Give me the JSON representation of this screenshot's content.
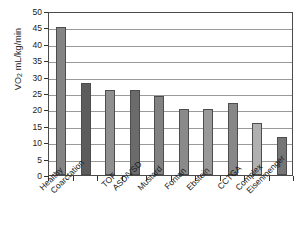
{
  "chart_data": {
    "type": "bar",
    "title": "",
    "subtitle": "",
    "xlabel": "",
    "ylabel": "VO2 mL/kg/min",
    "ylabel_parts": {
      "prefix": "VO",
      "subscript": "2",
      "suffix": " mL/kg/min"
    },
    "categories": [
      "Healthy",
      "Coarctation",
      "TOF",
      "ASD/VSD",
      "Mustard",
      "Fontan",
      "Ebstein",
      "CCTGA",
      "Complex",
      "Eisenmenger"
    ],
    "values": [
      45,
      28,
      26,
      26,
      24,
      20,
      20,
      22,
      16,
      11.7
    ],
    "bar_colors": [
      "#848484",
      "#5c5c5c",
      "#8f8f8f",
      "#6b6b6b",
      "#828282",
      "#8a8a8a",
      "#999999",
      "#878787",
      "#b0b0b0",
      "#767676"
    ],
    "ylim": [
      0,
      50
    ],
    "yticks": [
      0,
      5,
      10,
      15,
      20,
      25,
      30,
      35,
      40,
      45,
      50
    ],
    "ytick_labels": [
      "0",
      "5",
      "10",
      "15",
      "20",
      "25",
      "30",
      "35",
      "40",
      "45",
      "50"
    ],
    "grid": true,
    "grid_axis": "y",
    "legend": false,
    "legend_position": "none",
    "frame": true,
    "bar_width_fraction": 0.42,
    "colors": {
      "axis": "#4a4a4a",
      "gridline": "#9a9a9a",
      "text": "#1a1a1a",
      "background": "#ffffff",
      "bar_outline": "#4d4d4d"
    }
  }
}
